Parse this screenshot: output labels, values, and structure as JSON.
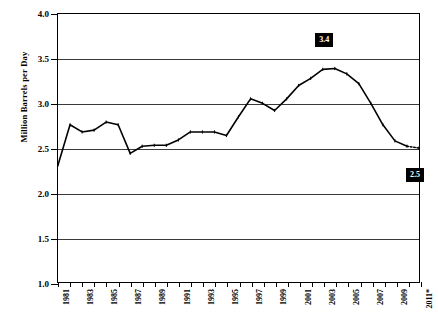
{
  "chart_data": {
    "type": "line",
    "title": "",
    "xlabel": "",
    "ylabel": "Million Barrels per Day",
    "ylim": [
      1.0,
      4.0
    ],
    "ytick_labels": [
      "4.0",
      "3.5",
      "3.0",
      "2.5",
      "2.0",
      "1.5",
      "1.0"
    ],
    "ytick_values": [
      4.0,
      3.5,
      3.0,
      2.5,
      2.0,
      1.5,
      1.0
    ],
    "grid": "horizontal",
    "legend": "none",
    "xlim": [
      1981,
      2011
    ],
    "x": [
      1981,
      1982,
      1983,
      1984,
      1985,
      1986,
      1987,
      1988,
      1989,
      1990,
      1991,
      1992,
      1993,
      1994,
      1995,
      1996,
      1997,
      1998,
      1999,
      2000,
      2001,
      2002,
      2003,
      2004,
      2005,
      2006,
      2007,
      2008,
      2009,
      2010,
      2011
    ],
    "xtick_labels": [
      "1981",
      "1982",
      "1983",
      "1984",
      "1985",
      "1986",
      "1987",
      "1988",
      "1989",
      "1990",
      "1991",
      "1992",
      "1993",
      "1994",
      "1995",
      "1996",
      "1997",
      "1998",
      "1999",
      "2000",
      "2001",
      "2002",
      "2003",
      "2004",
      "2005",
      "2006",
      "2007",
      "2008",
      "2009",
      "2010",
      "2011*"
    ],
    "xtick_labels_shown": [
      "1981",
      "1983",
      "1985",
      "1987",
      "1989",
      "1991",
      "1993",
      "1995",
      "1997",
      "1999",
      "2001",
      "2003",
      "2005",
      "2007",
      "2009",
      "2011*"
    ],
    "values": [
      2.31,
      2.76,
      2.68,
      2.7,
      2.79,
      2.76,
      2.44,
      2.52,
      2.53,
      2.53,
      2.59,
      2.68,
      2.68,
      2.68,
      2.64,
      2.85,
      3.05,
      3.0,
      2.92,
      3.05,
      3.2,
      3.28,
      3.38,
      3.39,
      3.33,
      3.22,
      3.0,
      2.76,
      2.58,
      2.52,
      2.5
    ],
    "series_color": "#000000",
    "projected_from": 2010,
    "callouts": [
      {
        "label": "3.4",
        "x_year": 2003,
        "value": 3.4
      },
      {
        "label": "2.5",
        "x_year": 2011,
        "value": 2.5
      }
    ],
    "footnote": "2011*"
  }
}
